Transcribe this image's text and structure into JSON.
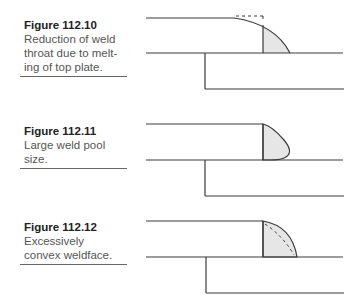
{
  "figures": [
    {
      "number": "Figure 112.10",
      "caption": "Reduction of weld throat due to melt-ing of top plate.",
      "caption_lines": [
        "Reduction of weld",
        "throat due to melt-",
        "ing of top plate."
      ]
    },
    {
      "number": "Figure 112.11",
      "caption": "Large weld pool size.",
      "caption_lines": [
        "Large weld pool",
        "size."
      ]
    },
    {
      "number": "Figure 112.12",
      "caption": "Excessively convex weldface.",
      "caption_lines": [
        "Excessively",
        "convex weldface."
      ]
    }
  ],
  "colors": {
    "line": "#3a3a3a",
    "weld_fill": "#e6e6e6"
  }
}
